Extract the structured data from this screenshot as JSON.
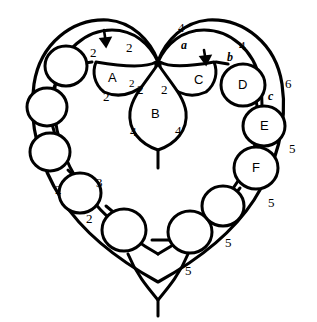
{
  "diagram": {
    "stroke_color": "#000000",
    "fill_color": "#ffffff",
    "node_labels": [
      {
        "id": "A",
        "text": "A",
        "x": 113,
        "y": 78
      },
      {
        "id": "B",
        "text": "B",
        "x": 156,
        "y": 114
      },
      {
        "id": "C",
        "text": "C",
        "x": 199,
        "y": 80
      },
      {
        "id": "D",
        "text": "D",
        "x": 243,
        "y": 85
      },
      {
        "id": "E",
        "text": "E",
        "x": 264,
        "y": 126
      },
      {
        "id": "F",
        "text": "F",
        "x": 256,
        "y": 168
      }
    ],
    "numeric_labels": [
      {
        "text": "2",
        "x": 94,
        "y": 53
      },
      {
        "text": "2",
        "x": 130,
        "y": 48
      },
      {
        "text": "2",
        "x": 107,
        "y": 97
      },
      {
        "text": "2",
        "x": 133,
        "y": 85
      },
      {
        "text": "2",
        "x": 140,
        "y": 90
      },
      {
        "text": "2",
        "x": 165,
        "y": 90
      },
      {
        "text": "4",
        "x": 133,
        "y": 132
      },
      {
        "text": "4",
        "x": 178,
        "y": 131
      },
      {
        "text": "4",
        "x": 181,
        "y": 28
      },
      {
        "text": "4",
        "x": 242,
        "y": 46
      },
      {
        "text": "6",
        "x": 288,
        "y": 84
      },
      {
        "text": "5",
        "x": 292,
        "y": 149
      },
      {
        "text": "5",
        "x": 271,
        "y": 203
      },
      {
        "text": "5",
        "x": 228,
        "y": 243
      },
      {
        "text": "5",
        "x": 188,
        "y": 271
      },
      {
        "text": "3",
        "x": 99,
        "y": 183
      },
      {
        "text": "2",
        "x": 58,
        "y": 190
      },
      {
        "text": "2",
        "x": 89,
        "y": 219
      }
    ],
    "italic_labels": [
      {
        "text": "a",
        "x": 184,
        "y": 45
      },
      {
        "text": "b",
        "x": 230,
        "y": 57
      },
      {
        "text": "c",
        "x": 271,
        "y": 96
      }
    ],
    "arrows": [
      {
        "name": "arrow-left-lobe",
        "x": 105,
        "y": 37
      },
      {
        "name": "arrow-right-lobe",
        "x": 205,
        "y": 57
      }
    ],
    "unlabeled_node_count": 9
  }
}
